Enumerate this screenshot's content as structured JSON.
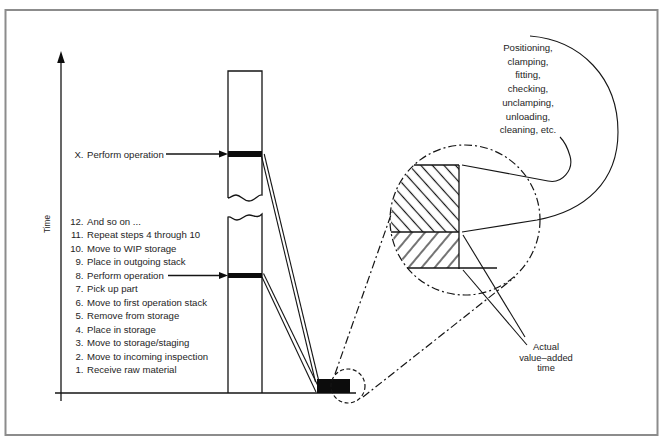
{
  "diagram": {
    "axis_label": "Time",
    "operation_x": {
      "number": "X.",
      "text": "Perform operation"
    },
    "steps": [
      {
        "number": "12.",
        "text": "And so on ..."
      },
      {
        "number": "11.",
        "text": "Repeat steps 4 through 10"
      },
      {
        "number": "10.",
        "text": "Move to WIP storage"
      },
      {
        "number": "9.",
        "text": "Place in outgoing stack"
      },
      {
        "number": "8.",
        "text": "Perform operation"
      },
      {
        "number": "7.",
        "text": "Pick up part"
      },
      {
        "number": "6.",
        "text": "Move to first operation stack"
      },
      {
        "number": "5.",
        "text": "Remove from storage"
      },
      {
        "number": "4.",
        "text": "Place in storage"
      },
      {
        "number": "3.",
        "text": "Move to storage/staging"
      },
      {
        "number": "2.",
        "text": "Move to incoming inspection"
      },
      {
        "number": "1.",
        "text": "Receive raw material"
      }
    ],
    "callout_lines": [
      "Positioning,",
      "clamping,",
      "fitting,",
      "checking,",
      "unclamping,",
      "unloading,",
      "cleaning, etc."
    ],
    "value_added_lines": [
      "Actual",
      "value–added",
      "time"
    ]
  }
}
